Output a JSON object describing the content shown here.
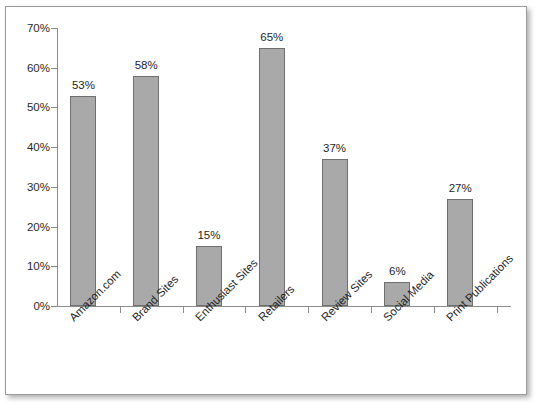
{
  "chart_data": {
    "type": "bar",
    "title": "",
    "subtitle": "",
    "xlabel": "",
    "ylabel": "",
    "categories": [
      "Amazon.com",
      "Brand Sites",
      "Enthusiast Sites",
      "Retailers",
      "Review Sites",
      "Social Media",
      "Print Publications"
    ],
    "values": [
      53,
      58,
      15,
      65,
      37,
      6,
      27
    ],
    "data_labels": [
      "53%",
      "58%",
      "15%",
      "65%",
      "37%",
      "6%",
      "27%"
    ],
    "ylim": [
      0,
      70
    ],
    "ytick_values": [
      0,
      10,
      20,
      30,
      40,
      50,
      60,
      70
    ],
    "ytick_labels": [
      "0%",
      "10%",
      "20%",
      "30%",
      "40%",
      "50%",
      "60%",
      "70%"
    ],
    "grid": false,
    "legend": null,
    "legend_position": "none",
    "bar_color": "#a9a9a9",
    "bar_border_color": "#6f6f6f",
    "axis_color": "#8c8c8c",
    "text_color": "#1f1f1f",
    "xtick_label_rotation": -45,
    "background_color": "#ffffff",
    "frame_border_color": "#9a9a9a"
  }
}
